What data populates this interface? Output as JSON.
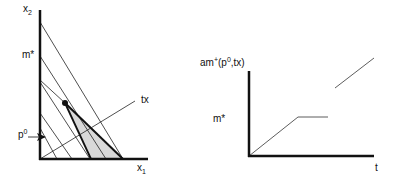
{
  "left_diagram": {
    "y_axis_label": "x",
    "y_axis_label_sub": "2",
    "x_axis_label": "x",
    "x_axis_label_sub": "1",
    "m_star_label": "m*",
    "p0_label": "p",
    "p0_label_sup": "0",
    "tx_label": "tx",
    "fill_color": "#d9d9d9",
    "line_color": "#111111"
  },
  "right_diagram": {
    "y_axis_label_prefix": "am",
    "y_axis_label_sup1": "+",
    "y_axis_label_mid": "(p",
    "y_axis_label_sup2": "0",
    "y_axis_label_suffix": ",tx)",
    "m_star_label": "m*",
    "x_axis_label": "t"
  }
}
